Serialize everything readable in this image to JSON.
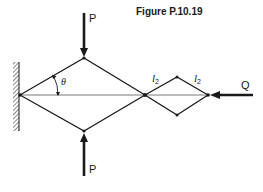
{
  "figure": {
    "title": "Figure P.10.19"
  },
  "labels": {
    "load_top": "P",
    "load_bottom": "P",
    "load_right": "Q",
    "angle": "θ",
    "link_left": "l",
    "link_left_sub": "2",
    "link_right": "l",
    "link_right_sub": "2"
  },
  "colors": {
    "ink": "#1a1a1a",
    "centerline": "#555555",
    "background": "#ffffff"
  },
  "geometry": {
    "wall_pivot": [
      20,
      95
    ],
    "big_diamond": {
      "left": [
        20,
        95
      ],
      "top": [
        84,
        58
      ],
      "right": [
        145,
        95
      ],
      "bottom": [
        84,
        131
      ]
    },
    "small_diamond": {
      "left": [
        145,
        95
      ],
      "top": [
        177,
        77
      ],
      "right": [
        208,
        95
      ],
      "bottom": [
        177,
        115
      ]
    }
  }
}
